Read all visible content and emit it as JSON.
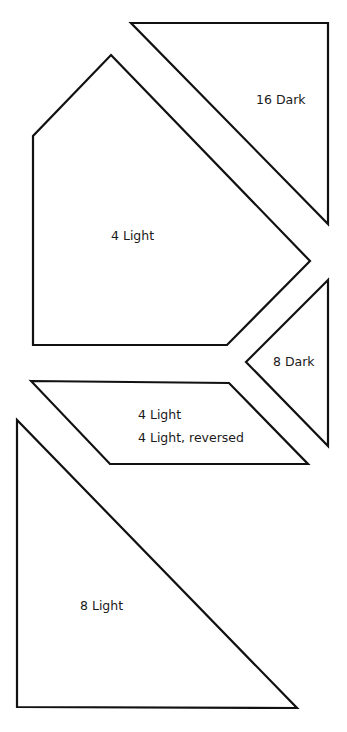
{
  "diagram": {
    "stroke_color": "#111111",
    "background": "#ffffff",
    "pieces": [
      {
        "id": "top-triangle",
        "points": "131,23 328,23 328,224",
        "labels": [
          {
            "text": "16 Dark",
            "x": 256,
            "y": 104
          }
        ]
      },
      {
        "id": "pentagon",
        "points": "111,55 310,261 227,345 33,345 33,136",
        "labels": [
          {
            "text": "4 Light",
            "x": 111,
            "y": 240
          }
        ]
      },
      {
        "id": "small-triangle",
        "points": "328,280 246,362 328,446",
        "labels": [
          {
            "text": "8 Dark",
            "x": 273,
            "y": 366
          }
        ]
      },
      {
        "id": "parallelogram",
        "points": "31,381 229,383 308,464 110,464",
        "labels": [
          {
            "text": "4 Light",
            "x": 138,
            "y": 419
          },
          {
            "text": "4 Light, reversed",
            "x": 138,
            "y": 442
          }
        ]
      },
      {
        "id": "bottom-triangle",
        "points": "17,420 17,707 297,708",
        "labels": [
          {
            "text": "8 Light",
            "x": 80,
            "y": 610
          }
        ]
      }
    ]
  }
}
